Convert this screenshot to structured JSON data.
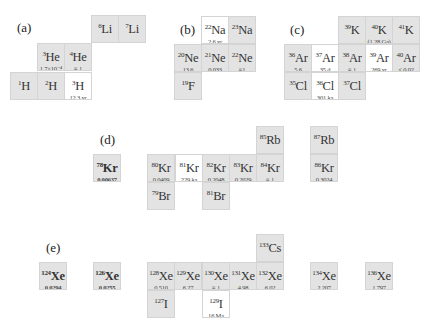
{
  "panels": [
    {
      "label": "(a)",
      "x": 17,
      "y": 20
    },
    {
      "label": "(b)",
      "x": 180,
      "y": 22
    },
    {
      "label": "(c)",
      "x": 290,
      "y": 22
    },
    {
      "label": "(d)",
      "x": 100,
      "y": 132
    },
    {
      "label": "(e)",
      "x": 46,
      "y": 240
    }
  ],
  "cells": [
    {
      "mass": "6",
      "el": "Li",
      "val": "",
      "type": "stable",
      "x": 91,
      "y": 15
    },
    {
      "mass": "7",
      "el": "Li",
      "val": "",
      "type": "stable",
      "x": 118,
      "y": 15
    },
    {
      "mass": "3",
      "el": "He",
      "val": "1.7×10⁻⁴",
      "type": "stable",
      "x": 37,
      "y": 43
    },
    {
      "mass": "4",
      "el": "He",
      "val": "≡ 1",
      "type": "stable",
      "x": 64,
      "y": 43
    },
    {
      "mass": "1",
      "el": "H",
      "val": "",
      "type": "stable",
      "x": 10,
      "y": 72
    },
    {
      "mass": "2",
      "el": "H",
      "val": "",
      "type": "stable",
      "x": 37,
      "y": 72
    },
    {
      "mass": "3",
      "el": "H",
      "val": "12.3 yr",
      "type": "radio",
      "x": 64,
      "y": 72
    },
    {
      "mass": "22",
      "el": "Na",
      "val": "2.6 yr",
      "type": "radio",
      "x": 201,
      "y": 16
    },
    {
      "mass": "23",
      "el": "Na",
      "val": "",
      "type": "stable",
      "x": 228,
      "y": 16
    },
    {
      "mass": "20",
      "el": "Ne",
      "val": "13.6",
      "type": "stable",
      "x": 174,
      "y": 44
    },
    {
      "mass": "21",
      "el": "Ne",
      "val": "0.033",
      "type": "stable",
      "x": 201,
      "y": 44
    },
    {
      "mass": "22",
      "el": "Ne",
      "val": "≡1",
      "type": "stable",
      "x": 228,
      "y": 44
    },
    {
      "mass": "19",
      "el": "F",
      "val": "",
      "type": "stable",
      "x": 174,
      "y": 72
    },
    {
      "mass": "39",
      "el": "K",
      "val": "",
      "type": "stable",
      "x": 338,
      "y": 16
    },
    {
      "mass": "40",
      "el": "K",
      "val": "(1.28 Ga)",
      "type": "stable",
      "x": 365,
      "y": 16
    },
    {
      "mass": "41",
      "el": "K",
      "val": "",
      "type": "stable",
      "x": 392,
      "y": 16
    },
    {
      "mass": "36",
      "el": "Ar",
      "val": "5.6",
      "type": "stable",
      "x": 284,
      "y": 44
    },
    {
      "mass": "37",
      "el": "Ar",
      "val": "35 d",
      "type": "radio",
      "x": 311,
      "y": 44
    },
    {
      "mass": "38",
      "el": "Ar",
      "val": "≡ 1",
      "type": "stable",
      "x": 338,
      "y": 44
    },
    {
      "mass": "39",
      "el": "Ar",
      "val": "269 yr",
      "type": "radio",
      "x": 365,
      "y": 44
    },
    {
      "mass": "40",
      "el": "Ar",
      "val": "< 0.02",
      "type": "stable",
      "x": 392,
      "y": 44
    },
    {
      "mass": "35",
      "el": "Cl",
      "val": "",
      "type": "stable",
      "x": 284,
      "y": 72
    },
    {
      "mass": "36",
      "el": "Cl",
      "val": "301 ka",
      "type": "radio",
      "x": 311,
      "y": 72
    },
    {
      "mass": "37",
      "el": "Cl",
      "val": "",
      "type": "stable",
      "x": 338,
      "y": 72
    },
    {
      "mass": "85",
      "el": "Rb",
      "val": "",
      "type": "stable",
      "x": 256,
      "y": 126
    },
    {
      "mass": "87",
      "el": "Rb",
      "val": "",
      "type": "stable",
      "x": 310,
      "y": 126
    },
    {
      "mass": "78",
      "el": "Kr",
      "val": "0.00637",
      "type": "stable",
      "bold": true,
      "x": 93,
      "y": 154
    },
    {
      "mass": "80",
      "el": "Kr",
      "val": "0.0409",
      "type": "stable",
      "x": 147,
      "y": 154
    },
    {
      "mass": "81",
      "el": "Kr",
      "val": "229 ka",
      "type": "radio",
      "x": 175,
      "y": 154
    },
    {
      "mass": "82",
      "el": "Kr",
      "val": "0.2048",
      "type": "stable",
      "x": 202,
      "y": 154
    },
    {
      "mass": "83",
      "el": "Kr",
      "val": "0.2029",
      "type": "stable",
      "x": 229,
      "y": 154
    },
    {
      "mass": "84",
      "el": "Kr",
      "val": "≡ 1",
      "type": "stable",
      "x": 256,
      "y": 154
    },
    {
      "mass": "86",
      "el": "Kr",
      "val": "0.3024",
      "type": "stable",
      "x": 310,
      "y": 154
    },
    {
      "mass": "79",
      "el": "Br",
      "val": "",
      "type": "stable",
      "x": 147,
      "y": 182
    },
    {
      "mass": "81",
      "el": "Br",
      "val": "",
      "type": "stable",
      "x": 202,
      "y": 182
    },
    {
      "mass": "133",
      "el": "Cs",
      "val": "",
      "type": "stable",
      "x": 256,
      "y": 234
    },
    {
      "mass": "124",
      "el": "Xe",
      "val": "0.0294",
      "type": "stable",
      "bold": true,
      "x": 39,
      "y": 262
    },
    {
      "mass": "126",
      "el": "Xe",
      "val": "0.0255",
      "type": "stable",
      "bold": true,
      "x": 93,
      "y": 262
    },
    {
      "mass": "128",
      "el": "Xe",
      "val": "0.510",
      "type": "stable",
      "x": 147,
      "y": 262
    },
    {
      "mass": "129",
      "el": "Xe",
      "val": "6.27",
      "type": "stable",
      "x": 174,
      "y": 262
    },
    {
      "mass": "130",
      "el": "Xe",
      "val": "≡ 1",
      "type": "stable",
      "x": 202,
      "y": 262
    },
    {
      "mass": "131",
      "el": "Xe",
      "val": "4.98",
      "type": "stable",
      "x": 229,
      "y": 262
    },
    {
      "mass": "132",
      "el": "Xe",
      "val": "6.02",
      "type": "stable",
      "x": 256,
      "y": 262
    },
    {
      "mass": "134",
      "el": "Xe",
      "val": "2.207",
      "type": "stable",
      "x": 310,
      "y": 262
    },
    {
      "mass": "136",
      "el": "Xe",
      "val": "1.797",
      "type": "stable",
      "x": 365,
      "y": 262
    },
    {
      "mass": "127",
      "el": "I",
      "val": "",
      "type": "stable",
      "x": 147,
      "y": 290
    },
    {
      "mass": "129",
      "el": "I",
      "val": "16 Ma",
      "type": "radio",
      "x": 202,
      "y": 290
    }
  ]
}
